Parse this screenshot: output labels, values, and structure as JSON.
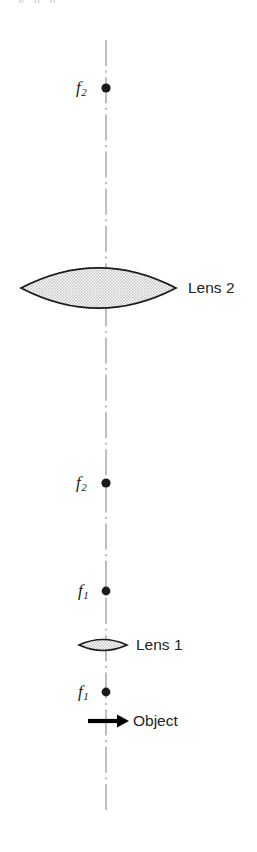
{
  "figure": {
    "type": "optics-ray-diagram",
    "canvas": {
      "width": 257,
      "height": 852,
      "background": "#ffffff"
    },
    "top_text_fragment": "y g g",
    "axis": {
      "name": "optical-axis",
      "style": "dash-dot centerline",
      "x": 106,
      "y_top": 40,
      "y_bottom": 810,
      "color": "#8a8a8a",
      "stroke_width": 1.1
    },
    "colors": {
      "ink": "#1a1a1a",
      "axis": "#8a8a8a",
      "lens_fill": "#e2e2e2",
      "lens_outline": "#1a1a1a",
      "arrow": "#000000",
      "faint_text": "#c9c9c9"
    },
    "points": [
      {
        "id": "f2-top",
        "label": "f",
        "sub": "2",
        "x": 106,
        "y": 88,
        "label_x": 76,
        "label_y": 79,
        "dot_r": 4.6
      },
      {
        "id": "f2-lower",
        "label": "f",
        "sub": "2",
        "x": 106,
        "y": 483,
        "label_x": 76,
        "label_y": 474,
        "dot_r": 4.6
      },
      {
        "id": "f1-upper",
        "label": "f",
        "sub": "1",
        "x": 106,
        "y": 591,
        "label_x": 78,
        "label_y": 582,
        "dot_r": 4.4
      },
      {
        "id": "f1-lower",
        "label": "f",
        "sub": "1",
        "x": 106,
        "y": 692,
        "label_x": 78,
        "label_y": 683,
        "dot_r": 4.4
      }
    ],
    "lenses": [
      {
        "id": "lens-2",
        "label": "Lens 2",
        "label_x": 188,
        "label_y": 280,
        "center_x": 98.5,
        "center_y": 288,
        "left_x": 21,
        "right_x": 176,
        "half_height": 20,
        "shape": "biconvex",
        "fill": "#e2e2e2",
        "outline": "#1a1a1a",
        "outline_width": 1.8
      },
      {
        "id": "lens-1",
        "label": "Lens 1",
        "label_x": 136,
        "label_y": 637,
        "center_x": 103,
        "center_y": 645,
        "left_x": 79,
        "right_x": 127,
        "half_height": 5.4,
        "shape": "biconvex",
        "fill": "#e2e2e2",
        "outline": "#1a1a1a",
        "outline_width": 1.6
      }
    ],
    "object_arrow": {
      "label": "Object",
      "label_x": 133,
      "label_y": 713,
      "x_start": 88,
      "x_tip": 129,
      "y": 721,
      "shaft_width": 4.2,
      "head_length": 12,
      "head_half_width": 6.5,
      "color": "#000000"
    }
  }
}
